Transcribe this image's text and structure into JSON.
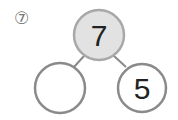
{
  "problem": {
    "number_label": "⑦"
  },
  "number_bond": {
    "whole": {
      "value": "7",
      "fill": "#e2e2e2"
    },
    "parts": [
      {
        "value": ""
      },
      {
        "value": "5"
      }
    ],
    "stroke_color": "#8a8a8a"
  }
}
